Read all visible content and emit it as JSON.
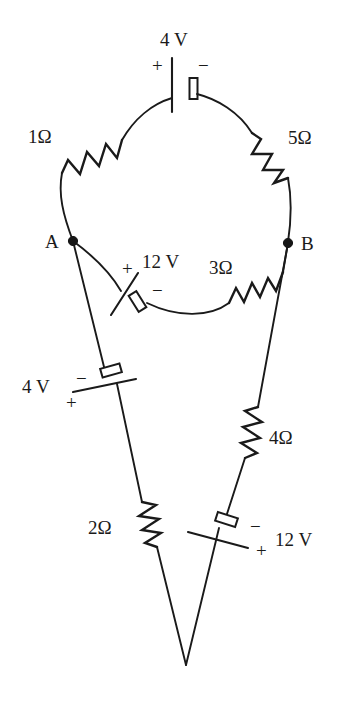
{
  "diagram": {
    "stroke_color": "#1a1a1a",
    "background_color": "#ffffff"
  },
  "nodes": [
    {
      "id": "A",
      "label": "A"
    },
    {
      "id": "B",
      "label": "B"
    }
  ],
  "components": {
    "source_top": {
      "value": "4 V",
      "plus": "+",
      "minus": "−"
    },
    "resistor_left_top": {
      "value": "1Ω"
    },
    "resistor_right_top": {
      "value": "5Ω"
    },
    "source_middle": {
      "value": "12 V",
      "plus": "+",
      "minus": "−"
    },
    "resistor_middle": {
      "value": "3Ω"
    },
    "source_lower_left": {
      "value": "4 V",
      "plus": "+",
      "minus": "−"
    },
    "resistor_lower_left": {
      "value": "2Ω"
    },
    "resistor_lower_right": {
      "value": "4Ω"
    },
    "source_lower_right": {
      "value": "12 V",
      "plus": "+",
      "minus": "−"
    }
  }
}
